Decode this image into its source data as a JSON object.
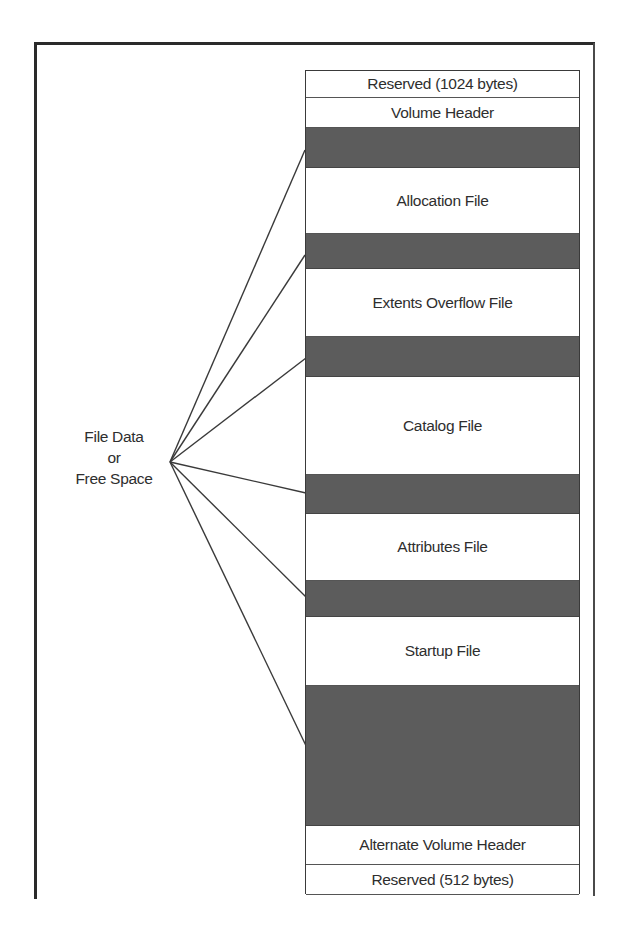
{
  "diagram": {
    "fan_label": {
      "line1": "File Data",
      "line2": "or",
      "line3": "Free Space"
    },
    "segments": [
      {
        "label": "Reserved (1024 bytes)",
        "type": "light",
        "top": 0,
        "height": 27
      },
      {
        "label": "Volume Header",
        "type": "light",
        "top": 27,
        "height": 30
      },
      {
        "label": "",
        "type": "dark",
        "top": 57,
        "height": 40
      },
      {
        "label": "Allocation File",
        "type": "light",
        "top": 97,
        "height": 66
      },
      {
        "label": "",
        "type": "dark",
        "top": 163,
        "height": 35
      },
      {
        "label": "Extents Overflow File",
        "type": "light",
        "top": 198,
        "height": 68
      },
      {
        "label": "",
        "type": "dark",
        "top": 266,
        "height": 40
      },
      {
        "label": "Catalog File",
        "type": "light",
        "top": 306,
        "height": 98
      },
      {
        "label": "",
        "type": "dark",
        "top": 404,
        "height": 39
      },
      {
        "label": "Attributes File",
        "type": "light",
        "top": 443,
        "height": 67
      },
      {
        "label": "",
        "type": "dark",
        "top": 510,
        "height": 36
      },
      {
        "label": "Startup File",
        "type": "light",
        "top": 546,
        "height": 69
      },
      {
        "label": "",
        "type": "dark",
        "top": 615,
        "height": 140
      },
      {
        "label": "Alternate Volume Header",
        "type": "light",
        "top": 755,
        "height": 39
      },
      {
        "label": "Reserved (512 bytes)",
        "type": "light",
        "top": 794,
        "height": 30
      }
    ],
    "fan_lines": {
      "origin": [
        170,
        462
      ],
      "targets": [
        [
          305,
          150
        ],
        [
          305,
          255
        ],
        [
          306,
          358
        ],
        [
          306,
          493
        ],
        [
          306,
          597
        ],
        [
          309,
          752
        ]
      ]
    },
    "colors": {
      "free_space_band": "#5c5c5c",
      "line": "#3a3a3a",
      "background": "#ffffff"
    }
  }
}
